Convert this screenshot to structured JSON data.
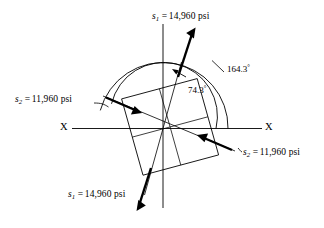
{
  "figure": {
    "type": "stress-element-diagram",
    "background_color": "#ffffff",
    "line_color": "#000000"
  },
  "labels": {
    "stress_top": {
      "symbol": "s",
      "subscript": "1",
      "equals": "=",
      "value": "14,960",
      "unit": "psi"
    },
    "stress_bottom": {
      "symbol": "s",
      "subscript": "1",
      "equals": "=",
      "value": "14,960",
      "unit": "psi"
    },
    "stress_left": {
      "symbol": "s",
      "subscript": "2",
      "equals": "=",
      "value": "11,960",
      "unit": "psi"
    },
    "stress_right": {
      "symbol": "s",
      "subscript": "2",
      "equals": "=",
      "value": "11,960",
      "unit": "psi"
    }
  },
  "angles": {
    "inner": {
      "value": "74.3",
      "degree": "°"
    },
    "outer": {
      "value": "164.3",
      "degree": "°"
    }
  },
  "axis": {
    "left_label": "X",
    "right_label": "X"
  }
}
